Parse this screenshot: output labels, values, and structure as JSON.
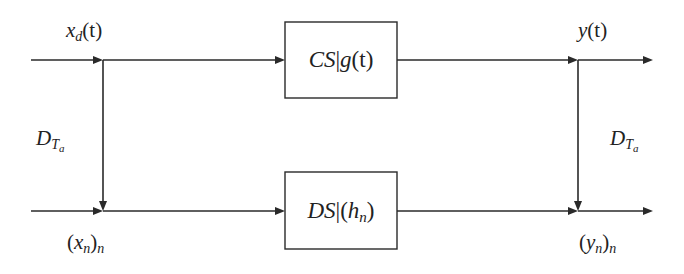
{
  "diagram": {
    "type": "block-diagram",
    "colors": {
      "stroke": "#2a2a2a",
      "text": "#222222",
      "background": "#ffffff"
    },
    "top_path": {
      "input_label": {
        "base": "x",
        "sub": "d",
        "arg": "(t)"
      },
      "block": {
        "prefix": "CS",
        "bar": "|",
        "func": "g",
        "arg": "(t)"
      },
      "output_label": {
        "base": "y",
        "arg": "(t)"
      }
    },
    "bottom_path": {
      "input_label": {
        "open": "(",
        "base": "x",
        "sub": "n",
        "close": ")",
        "outer_sub": "n"
      },
      "block": {
        "prefix": "DS",
        "bar": "|",
        "open": "(",
        "func": "h",
        "sub": "n",
        "close": ")"
      },
      "output_label": {
        "open": "(",
        "base": "y",
        "sub": "n",
        "close": ")",
        "outer_sub": "n"
      }
    },
    "left_branch_label": {
      "base": "D",
      "sub": "T",
      "subsub": "a"
    },
    "right_branch_label": {
      "base": "D",
      "sub": "T",
      "subsub": "a"
    }
  }
}
